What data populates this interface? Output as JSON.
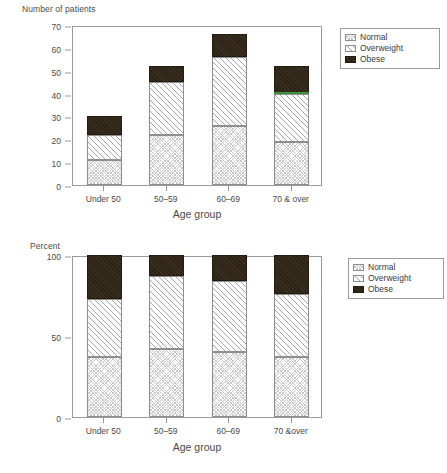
{
  "figure": {
    "legend_labels": [
      "Normal",
      "Overweight",
      "Obese"
    ],
    "colors": {
      "normal": "#fbfbfb",
      "overweight": "#fcfcfc",
      "obese": "#2f2418",
      "axis": "#9a9a9a",
      "text": "#4a4a4a",
      "artifact_green": "#3fa63f"
    }
  },
  "chart_data": [
    {
      "type": "bar",
      "stacked": true,
      "title": "",
      "ylabel": "Number of patients",
      "xlabel": "Age group",
      "categories": [
        "Under 50",
        "50–59",
        "60–69",
        "70 & over"
      ],
      "ylim": [
        0,
        70
      ],
      "yticks": [
        0,
        10,
        20,
        30,
        40,
        50,
        60,
        70
      ],
      "ytick_labels": [
        "0",
        "10",
        "20",
        "30",
        "40",
        "50",
        "60",
        "70"
      ],
      "grid": false,
      "legend_position": "right-outside",
      "series": [
        {
          "name": "Normal",
          "values": [
            11,
            22,
            26,
            19
          ]
        },
        {
          "name": "Overweight",
          "values": [
            11,
            23,
            30,
            21
          ]
        },
        {
          "name": "Obese",
          "values": [
            8,
            7,
            10,
            12
          ]
        }
      ],
      "totals": [
        30,
        52,
        66,
        52
      ]
    },
    {
      "type": "bar",
      "stacked": true,
      "title": "",
      "ylabel": "Percent",
      "xlabel": "Age group",
      "categories": [
        "Under 50",
        "50–59",
        "60–69",
        "70 &over"
      ],
      "ylim": [
        0,
        100
      ],
      "yticks": [
        0,
        50,
        100
      ],
      "ytick_labels": [
        "0",
        "50",
        "100"
      ],
      "grid": false,
      "legend_position": "right-outside",
      "series": [
        {
          "name": "Normal",
          "values": [
            37,
            42,
            40,
            37
          ]
        },
        {
          "name": "Overweight",
          "values": [
            36,
            45,
            44,
            39
          ]
        },
        {
          "name": "Obese",
          "values": [
            27,
            13,
            16,
            24
          ]
        }
      ],
      "totals": [
        100,
        100,
        100,
        100
      ]
    }
  ]
}
